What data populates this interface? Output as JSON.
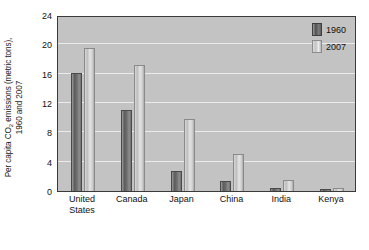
{
  "chart_data": {
    "type": "bar",
    "title": "",
    "xlabel": "",
    "ylabel_line1": "Per capita CO",
    "ylabel_sub": "2",
    "ylabel_line1b": " emissions (metric tons),",
    "ylabel_line2": "1960 and 2007",
    "ylabel": "Per capita CO2 emissions (metric tons), 1960 and 2007",
    "categories": [
      "United States",
      "Canada",
      "Japan",
      "China",
      "India",
      "Kenya"
    ],
    "category_lines": [
      [
        "United",
        "States"
      ],
      [
        "Canada",
        ""
      ],
      [
        "Japan",
        ""
      ],
      [
        "China",
        ""
      ],
      [
        "India",
        ""
      ],
      [
        "Kenya",
        ""
      ]
    ],
    "series": [
      {
        "name": "1960",
        "values": [
          16.0,
          10.9,
          2.6,
          1.2,
          0.25,
          0.2
        ]
      },
      {
        "name": "2007",
        "values": [
          19.3,
          17.0,
          9.7,
          4.9,
          1.4,
          0.3
        ]
      }
    ],
    "ylim": [
      0,
      24
    ],
    "yticks": [
      0,
      4,
      8,
      12,
      16,
      20,
      24
    ],
    "ytick_labels": [
      "0",
      "4",
      "8",
      "12",
      "16",
      "20",
      "24"
    ],
    "grid": true,
    "grid_axis": "y",
    "legend_position": "top-right",
    "colors": {
      "series_1960": "#5c5c5c",
      "series_2007": "#cfcfcf",
      "plot_background": "#c3c3c3",
      "gridline": "#eceaea",
      "axis_border": "#3a3a3a",
      "text": "#111111",
      "page_background": "#ffffff"
    }
  }
}
